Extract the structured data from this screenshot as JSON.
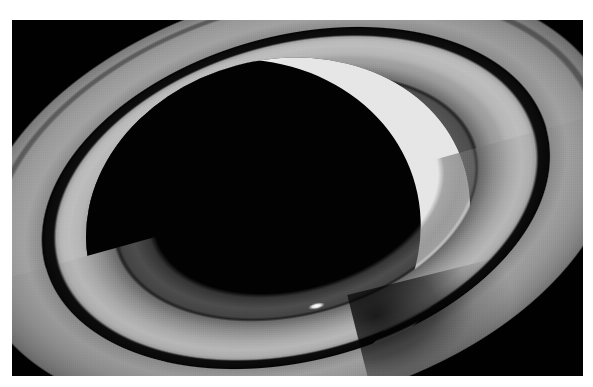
{
  "image": {
    "kind": "astronomical-photograph",
    "subject": "Saturn",
    "view": "backlit crescent with tilted ring system",
    "palette": "grayscale",
    "caption_text": ""
  },
  "frame": {
    "border_color": "#ffffff",
    "sky_color": "#010101",
    "left": 12,
    "top": 20,
    "width": 571,
    "height": 356
  },
  "planet": {
    "name": "planet-globe",
    "night_side_color": "#020202",
    "crescent_color": "#e8e8e8",
    "crescent_edge": "sunlit limb on the right / lower-right"
  },
  "rings": {
    "tilt_degrees": -15.5,
    "features": [
      {
        "id": "a-ring",
        "label": "A ring",
        "tone": "#9a9a9a"
      },
      {
        "id": "encke-gap",
        "label": "Encke gap",
        "tone": "#1e1e1e"
      },
      {
        "id": "cassini-division",
        "label": "Cassini Division",
        "tone": "#0b0b0b"
      },
      {
        "id": "b-ring",
        "label": "B ring",
        "tone": "#bdbdbd"
      },
      {
        "id": "c-ring",
        "label": "C ring",
        "tone": "#767676"
      }
    ],
    "shadow_note": "planet shadow cast across rings at right"
  },
  "bright_spot": {
    "label": "bright ring knot",
    "color": "#ffffff",
    "x": 304,
    "y": 286
  },
  "chart_data": {
    "type": "heatmap",
    "xlabel": "",
    "ylabel": "",
    "categories": [
      "sky",
      "night-side globe",
      "C ring",
      "Cassini Division",
      "A ring",
      "B ring",
      "crescent limb",
      "bright knot"
    ],
    "values": [
      1,
      2,
      118,
      11,
      154,
      189,
      232,
      255
    ],
    "ylim": [
      0,
      255
    ],
    "grid": false,
    "legend": "none"
  }
}
